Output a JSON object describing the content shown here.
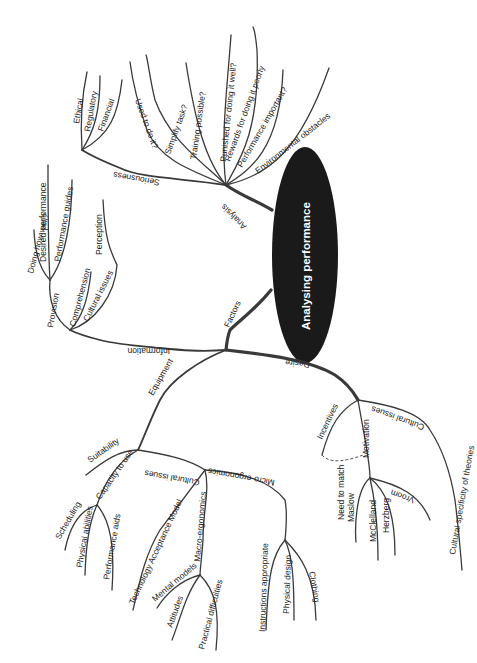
{
  "diagram": {
    "type": "mind-map",
    "orientation": "rotated 90° clockwise (text reads bottom-to-top)",
    "colors": {
      "line": "#3a3a3a",
      "center_fill": "#1a1a1a",
      "center_text": "#ffffff",
      "background": "#ffffff"
    },
    "center": {
      "label": "Analysing performance"
    },
    "branches": {
      "analysis": {
        "label": "Analysis",
        "seriousness": {
          "label": "Seriousness",
          "children": [
            "Ethical",
            "Regulatory",
            "Financial"
          ]
        },
        "children": [
          "Used to do it?",
          "Simplify task?",
          "Training possible?",
          "Punished for doing it well?",
          "Rewards for doing it poorly",
          "Performance important?",
          "Environmental obstacles"
        ]
      },
      "factors": {
        "label": "Factors",
        "information": {
          "label": "Information",
          "provision": {
            "label": "Provision",
            "children": [
              "Doing how well?",
              "Desired performance",
              "Performance guides"
            ]
          },
          "children": [
            "Comprehension",
            "Cultural issues"
          ],
          "perception": "Perception"
        },
        "equipment": {
          "label": "Equipment",
          "suitability": "Suitability",
          "capacity": {
            "label": "Capacity to use",
            "children": [
              "Scheduling",
              "Physical abilities",
              "Performance aids"
            ]
          },
          "cultural_issues": "Cultural issues",
          "tam": "Technology Acceptance Model",
          "macro": {
            "label": "Macro-ergonomics",
            "children": [
              "Mental models",
              "Attitudes",
              "Practical difficulties"
            ]
          },
          "micro": {
            "label": "Micro-ergonomics",
            "children": [
              "Instructions appropriate",
              "Physical design",
              "Clothing"
            ]
          }
        },
        "desire": {
          "label": "Desire",
          "incentives": "Incentives",
          "motivation": {
            "label": "Motivation",
            "children": [
              "Maslow",
              "McClelland",
              "Herzberg",
              "Vroom"
            ]
          },
          "need_to_match": "Need to match",
          "cultural_issues": "Cultural issues",
          "cultural_specificity": "Cultural specificity of theories"
        }
      }
    }
  }
}
